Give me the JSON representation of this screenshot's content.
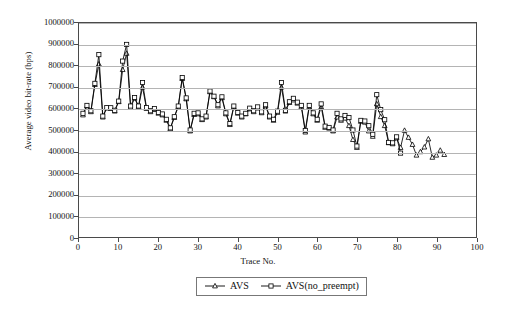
{
  "chart_data": {
    "type": "line",
    "title": "",
    "xlabel": "Trace No.",
    "ylabel": "Average video bit-rate (bps)",
    "xlim": [
      0,
      100
    ],
    "ylim": [
      0,
      1000000
    ],
    "xticks": [
      0,
      10,
      20,
      30,
      40,
      50,
      60,
      70,
      80,
      90,
      100
    ],
    "yticks": [
      0,
      100000,
      200000,
      300000,
      400000,
      500000,
      600000,
      700000,
      800000,
      900000,
      1000000
    ],
    "grid": "horizontal",
    "legend_position": "below-center",
    "x": [
      1,
      2,
      3,
      4,
      5,
      6,
      7,
      8,
      9,
      10,
      11,
      12,
      13,
      14,
      15,
      16,
      17,
      18,
      19,
      20,
      21,
      22,
      23,
      24,
      25,
      26,
      27,
      28,
      29,
      30,
      31,
      32,
      33,
      34,
      35,
      36,
      37,
      38,
      39,
      40,
      41,
      42,
      43,
      44,
      45,
      46,
      47,
      48,
      49,
      50,
      51,
      52,
      53,
      54,
      55,
      56,
      57,
      58,
      59,
      60,
      61,
      62,
      63,
      64,
      65,
      66,
      67,
      68,
      69,
      70,
      71,
      72,
      73,
      74,
      75,
      76,
      77,
      78,
      79,
      80,
      81,
      82,
      83,
      84,
      85,
      86,
      87,
      88,
      89,
      90,
      91,
      92
    ],
    "series": [
      {
        "name": "AVS",
        "marker": "triangle",
        "values": [
          570000,
          612000,
          585000,
          712000,
          808000,
          560000,
          602000,
          600000,
          588000,
          632000,
          782000,
          858000,
          605000,
          648000,
          608000,
          700000,
          600000,
          585000,
          595000,
          578000,
          570000,
          545000,
          505000,
          558000,
          608000,
          740000,
          645000,
          495000,
          572000,
          575000,
          548000,
          560000,
          678000,
          655000,
          612000,
          650000,
          575000,
          525000,
          608000,
          578000,
          560000,
          575000,
          598000,
          585000,
          602000,
          580000,
          612000,
          560000,
          545000,
          582000,
          700000,
          588000,
          628000,
          640000,
          625000,
          608000,
          490000,
          608000,
          575000,
          545000,
          608000,
          512000,
          508000,
          495000,
          560000,
          545000,
          555000,
          520000,
          455000,
          418000,
          540000,
          536000,
          495000,
          470000,
          622000,
          562000,
          520000,
          440000,
          435000,
          462000,
          418000,
          498000,
          465000,
          432000,
          382000,
          398000,
          420000,
          458000,
          372000,
          382000,
          405000,
          385000
        ]
      },
      {
        "name": "AVS(no_preempt)",
        "marker": "square",
        "values": [
          578000,
          615000,
          590000,
          718000,
          852000,
          565000,
          605000,
          604000,
          592000,
          635000,
          822000,
          900000,
          612000,
          652000,
          612000,
          722000,
          605000,
          590000,
          600000,
          582000,
          575000,
          550000,
          510000,
          562000,
          612000,
          745000,
          650000,
          500000,
          578000,
          580000,
          552000,
          565000,
          682000,
          658000,
          618000,
          655000,
          580000,
          530000,
          612000,
          582000,
          565000,
          578000,
          602000,
          590000,
          608000,
          585000,
          618000,
          565000,
          550000,
          588000,
          722000,
          592000,
          632000,
          648000,
          630000,
          615000,
          498000,
          615000,
          580000,
          550000,
          622000,
          518000,
          512000,
          500000,
          578000,
          552000,
          568000,
          558000,
          500000,
          425000,
          545000,
          542000,
          520000,
          480000,
          665000,
          595000,
          548000,
          442000,
          440000,
          468000,
          392000,
          null,
          null,
          null,
          null,
          null,
          null,
          null,
          null,
          null,
          null,
          null
        ]
      }
    ]
  },
  "legend": {
    "entries": [
      {
        "label": "AVS",
        "marker": "triangle"
      },
      {
        "label": "AVS(no_preempt)",
        "marker": "square"
      }
    ]
  },
  "axes": {
    "y_title": "Average video bit-rate (bps)",
    "x_title": "Trace No."
  }
}
